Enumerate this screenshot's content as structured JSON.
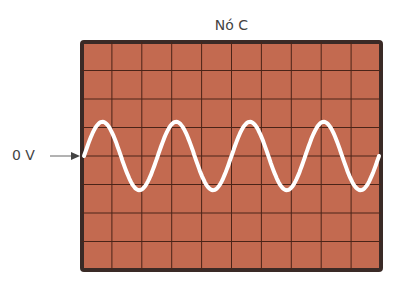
{
  "diagram": {
    "title": "Nó C",
    "zero_label": "0 V",
    "grid": {
      "columns": 10,
      "rows": 8
    },
    "waveform": {
      "type": "sine",
      "cycles": 4,
      "amplitude_divisions": 1.2,
      "start_phase": "rising from 0 V"
    },
    "colors": {
      "screen": "#c36a50",
      "grid": "#4a2418",
      "border": "#3a2a26",
      "trace": "#ffffff",
      "text": "#444444"
    }
  }
}
